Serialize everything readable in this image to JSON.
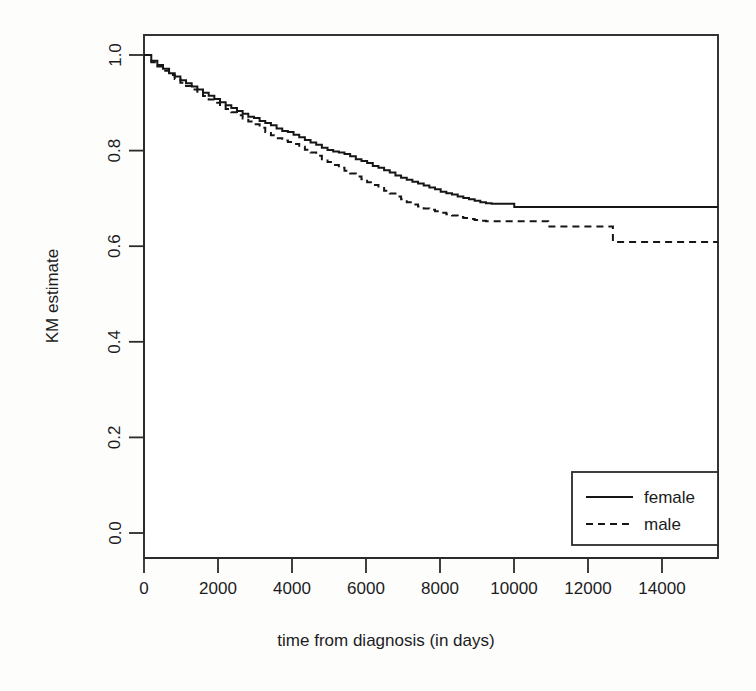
{
  "chart_data": {
    "type": "line",
    "title": "",
    "subtitle": "",
    "xlabel": "time from diagnosis (in days)",
    "ylabel": "KM estimate",
    "xlim": [
      -350,
      14950
    ],
    "ylim": [
      -0.04,
      1.04
    ],
    "xticks": [
      0,
      2000,
      4000,
      6000,
      8000,
      10000,
      12000,
      14000
    ],
    "xtick_labels": [
      "0",
      "2000",
      "4000",
      "6000",
      "8000",
      "10000",
      "12000",
      "14000"
    ],
    "yticks": [
      0.0,
      0.2,
      0.4,
      0.6,
      0.8,
      1.0
    ],
    "ytick_labels": [
      "0.0",
      "0.2",
      "0.4",
      "0.6",
      "0.8",
      "1.0"
    ],
    "grid": false,
    "legend_position": "bottom-right",
    "series": [
      {
        "name": "female",
        "style": "solid",
        "color": "#161616",
        "final_value": 0.682,
        "x": [
          0,
          180,
          330,
          470,
          620,
          760,
          900,
          1040,
          1180,
          1320,
          1460,
          1600,
          1740,
          1880,
          2020,
          2160,
          2300,
          2440,
          2580,
          2720,
          2860,
          3000,
          3140,
          3280,
          3420,
          3560,
          3700,
          3840,
          3980,
          4120,
          4260,
          4400,
          4540,
          4680,
          4820,
          4960,
          5100,
          5240,
          5380,
          5520,
          5660,
          5800,
          5940,
          6080,
          6220,
          6360,
          6500,
          6640,
          6780,
          6920,
          7060,
          7200,
          7340,
          7480,
          7620,
          7760,
          7900,
          8040,
          8180,
          8320,
          8460,
          8600,
          8740,
          8880,
          9020,
          9160,
          9400,
          10000,
          11000,
          12000,
          13000,
          14200
        ],
        "y": [
          1.0,
          0.988,
          0.979,
          0.971,
          0.962,
          0.955,
          0.947,
          0.941,
          0.934,
          0.928,
          0.921,
          0.915,
          0.908,
          0.901,
          0.895,
          0.889,
          0.883,
          0.877,
          0.871,
          0.868,
          0.862,
          0.858,
          0.853,
          0.846,
          0.841,
          0.839,
          0.833,
          0.828,
          0.822,
          0.817,
          0.812,
          0.806,
          0.801,
          0.798,
          0.796,
          0.793,
          0.788,
          0.782,
          0.778,
          0.774,
          0.768,
          0.764,
          0.759,
          0.754,
          0.748,
          0.743,
          0.739,
          0.735,
          0.731,
          0.727,
          0.723,
          0.719,
          0.714,
          0.711,
          0.708,
          0.704,
          0.701,
          0.698,
          0.695,
          0.692,
          0.69,
          0.689,
          0.689,
          0.689,
          0.689,
          0.682,
          0.682,
          0.682,
          0.682,
          0.682,
          0.682,
          0.682
        ]
      },
      {
        "name": "male",
        "style": "dashed",
        "color": "#161616",
        "final_value": 0.609,
        "x": [
          0,
          180,
          330,
          470,
          620,
          760,
          900,
          1040,
          1180,
          1320,
          1460,
          1600,
          1740,
          1880,
          2020,
          2160,
          2300,
          2440,
          2580,
          2720,
          2860,
          3000,
          3140,
          3280,
          3420,
          3560,
          3700,
          3840,
          3980,
          4120,
          4260,
          4400,
          4540,
          4680,
          4820,
          4960,
          5100,
          5240,
          5380,
          5520,
          5660,
          5800,
          5940,
          6080,
          6220,
          6360,
          6500,
          6640,
          6780,
          6920,
          7060,
          7200,
          7340,
          7480,
          7620,
          7760,
          7900,
          8040,
          8180,
          8320,
          8460,
          8700,
          9000,
          9500,
          9900,
          10000,
          10600,
          11400,
          11600,
          12000,
          13000,
          14200
        ],
        "y": [
          1.0,
          0.985,
          0.976,
          0.967,
          0.958,
          0.95,
          0.942,
          0.935,
          0.928,
          0.921,
          0.914,
          0.907,
          0.9,
          0.893,
          0.887,
          0.88,
          0.874,
          0.867,
          0.861,
          0.855,
          0.848,
          0.839,
          0.832,
          0.826,
          0.821,
          0.818,
          0.814,
          0.808,
          0.802,
          0.796,
          0.789,
          0.782,
          0.776,
          0.77,
          0.764,
          0.758,
          0.752,
          0.746,
          0.74,
          0.734,
          0.728,
          0.722,
          0.716,
          0.71,
          0.704,
          0.698,
          0.692,
          0.687,
          0.683,
          0.679,
          0.676,
          0.673,
          0.67,
          0.667,
          0.664,
          0.661,
          0.659,
          0.657,
          0.655,
          0.653,
          0.652,
          0.652,
          0.652,
          0.652,
          0.652,
          0.641,
          0.641,
          0.641,
          0.609,
          0.609,
          0.609,
          0.609
        ]
      }
    ],
    "legend": [
      {
        "label": "female",
        "style": "solid"
      },
      {
        "label": "male",
        "style": "dashed"
      }
    ]
  },
  "colors": {
    "line": "#161616",
    "frame": "#2b2b2b",
    "background": "#fdfdfc",
    "text": "#1c1c1c"
  }
}
